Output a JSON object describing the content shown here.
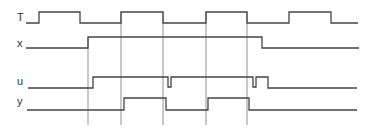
{
  "diagram": {
    "type": "timing-diagram",
    "colors": {
      "waveform": "#444444",
      "guide": "#777777",
      "label": "#333333",
      "background": "#ffffff"
    },
    "signals": [
      {
        "name": "T",
        "label": "T",
        "label_pos": [
          17,
          21
        ],
        "points": [
          [
            26,
            23
          ],
          [
            39,
            23
          ],
          [
            39,
            12
          ],
          [
            80,
            12
          ],
          [
            80,
            23
          ],
          [
            121,
            23
          ],
          [
            121,
            12
          ],
          [
            163,
            12
          ],
          [
            163,
            23
          ],
          [
            206,
            23
          ],
          [
            206,
            12
          ],
          [
            247,
            12
          ],
          [
            247,
            23
          ],
          [
            289,
            23
          ],
          [
            289,
            12
          ],
          [
            331,
            12
          ],
          [
            331,
            23
          ],
          [
            358,
            23
          ]
        ]
      },
      {
        "name": "x",
        "label": "x",
        "label_pos": [
          17,
          47
        ],
        "points": [
          [
            26,
            48
          ],
          [
            88,
            48
          ],
          [
            88,
            37
          ],
          [
            262,
            37
          ],
          [
            262,
            48
          ],
          [
            359,
            48
          ]
        ]
      },
      {
        "name": "u",
        "label": "u",
        "label_pos": [
          17,
          85
        ],
        "points": [
          [
            28,
            88
          ],
          [
            93,
            88
          ],
          [
            93,
            77
          ],
          [
            168,
            77
          ],
          [
            168,
            87
          ],
          [
            171,
            87
          ],
          [
            171,
            77
          ],
          [
            253,
            77
          ],
          [
            253,
            87
          ],
          [
            256,
            87
          ],
          [
            256,
            77
          ],
          [
            268,
            77
          ],
          [
            268,
            88
          ],
          [
            357,
            88
          ]
        ]
      },
      {
        "name": "y",
        "label": "y",
        "label_pos": [
          17,
          105
        ],
        "points": [
          [
            27,
            110
          ],
          [
            124,
            110
          ],
          [
            124,
            98
          ],
          [
            166,
            98
          ],
          [
            166,
            110
          ],
          [
            208,
            110
          ],
          [
            208,
            98
          ],
          [
            249,
            98
          ],
          [
            249,
            110
          ],
          [
            357,
            110
          ]
        ]
      }
    ],
    "guides": [
      {
        "x": 88,
        "y1": 37,
        "y2": 125
      },
      {
        "x": 121,
        "y1": 12,
        "y2": 125
      },
      {
        "x": 163,
        "y1": 12,
        "y2": 125
      },
      {
        "x": 206,
        "y1": 12,
        "y2": 125
      },
      {
        "x": 247,
        "y1": 12,
        "y2": 125
      }
    ]
  }
}
